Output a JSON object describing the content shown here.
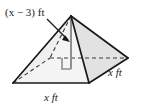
{
  "figure": {
    "name": "square-pyramid-diagram",
    "shape": "square pyramid",
    "labels": {
      "height": "(x − 3) ft",
      "base_front": "x ft",
      "base_right": "x ft"
    },
    "annotations": {
      "right_angle_marker": "right-angle",
      "leader_arrow": "arrow pointing to height segment",
      "hidden_edges": "dashed"
    },
    "colors": {
      "background": "#ffffff",
      "outline": "#1a1a1a",
      "face_light": "#f2f2f2",
      "face_mid": "#e3e3e3",
      "face_shadow": "#d8d8d8",
      "dashed": "#3a3a3a",
      "height_line": "#8a8a8a",
      "text": "#1a1a1a"
    }
  }
}
